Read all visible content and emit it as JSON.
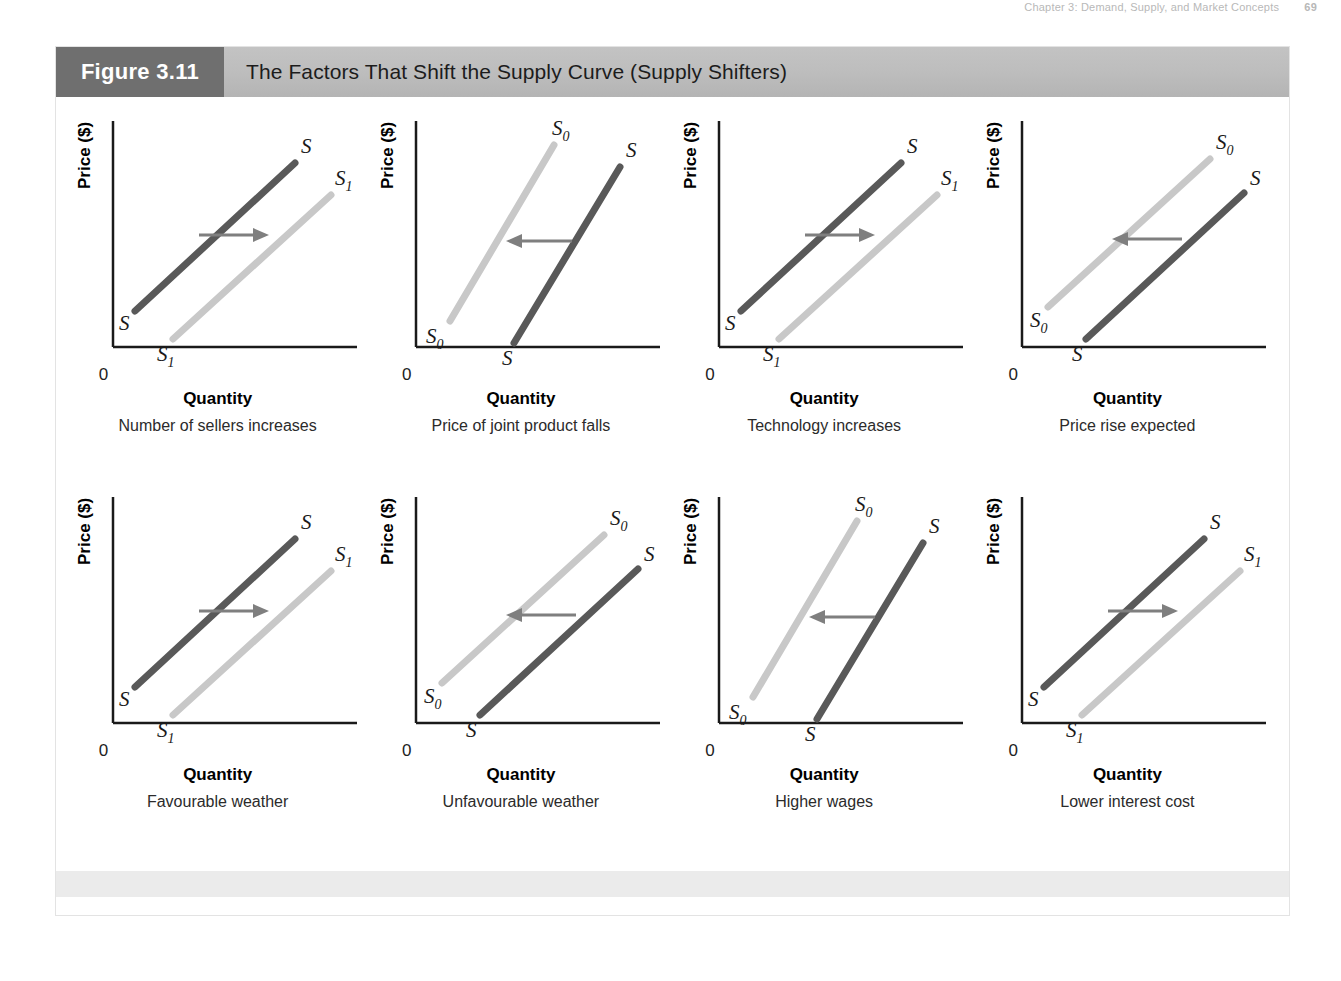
{
  "running_header": {
    "text": "Chapter 3: Demand, Supply, and Market Concepts",
    "page": "69"
  },
  "figure": {
    "number": "Figure 3.11",
    "title": "The Factors That Shift the Supply Curve (Supply Shifters)"
  },
  "axes": {
    "ylabel": "Price ($)",
    "xlabel": "Quantity",
    "origin": "0"
  },
  "colors": {
    "original_curve": "#595959",
    "shifted_curve": "#c8c8c8",
    "arrow": "#7f7f7f",
    "axis": "#1a1a1a",
    "title_block": "#6f6f6f",
    "title_bar": "#bdbdbd",
    "footer_band": "#ebebeb"
  },
  "chart_data": {
    "type": "line",
    "title": "The Factors That Shift the Supply Curve (Supply Shifters)",
    "xlabel": "Quantity",
    "ylabel": "Price ($)",
    "grid": false,
    "legend": "none",
    "note": "Eight small supply-and-shift diagrams. Each shows an original upward-sloping supply curve and a shifted supply curve, with an arrow indicating the direction of the shift.",
    "panels": [
      {
        "index": 1,
        "caption": "Number of sellers increases",
        "shift_direction": "right",
        "arrow": "→",
        "curves": [
          {
            "name": "S",
            "role": "original",
            "color": "dark",
            "label_start": "S",
            "label_end": "S"
          },
          {
            "name": "S1",
            "role": "shifted",
            "color": "light",
            "label_start": "S₁",
            "label_end": "S₁"
          }
        ]
      },
      {
        "index": 2,
        "caption": "Price of joint product falls",
        "shift_direction": "left",
        "arrow": "←",
        "curves": [
          {
            "name": "S0",
            "role": "original",
            "color": "light",
            "label_start": "S₀",
            "label_end": "S₀"
          },
          {
            "name": "S",
            "role": "shifted",
            "color": "dark",
            "label_start": "S",
            "label_end": "S"
          }
        ]
      },
      {
        "index": 3,
        "caption": "Technology increases",
        "shift_direction": "right",
        "arrow": "→",
        "curves": [
          {
            "name": "S",
            "role": "original",
            "color": "dark",
            "label_start": "S",
            "label_end": "S"
          },
          {
            "name": "S1",
            "role": "shifted",
            "color": "light",
            "label_start": "S₁",
            "label_end": "S₁"
          }
        ]
      },
      {
        "index": 4,
        "caption": "Price rise expected",
        "shift_direction": "left",
        "arrow": "←",
        "curves": [
          {
            "name": "S0",
            "role": "original",
            "color": "light",
            "label_start": "S₀",
            "label_end": "S₀"
          },
          {
            "name": "S",
            "role": "shifted",
            "color": "dark",
            "label_start": "S",
            "label_end": "S"
          }
        ]
      },
      {
        "index": 5,
        "caption": "Favourable weather",
        "shift_direction": "right",
        "arrow": "→",
        "curves": [
          {
            "name": "S",
            "role": "original",
            "color": "dark",
            "label_start": "S",
            "label_end": "S"
          },
          {
            "name": "S1",
            "role": "shifted",
            "color": "light",
            "label_start": "S₁",
            "label_end": "S₁"
          }
        ]
      },
      {
        "index": 6,
        "caption": "Unfavourable weather",
        "shift_direction": "left",
        "arrow": "←",
        "curves": [
          {
            "name": "S0",
            "role": "original",
            "color": "light",
            "label_start": "S₀",
            "label_end": "S₀"
          },
          {
            "name": "S",
            "role": "shifted",
            "color": "dark",
            "label_start": "S",
            "label_end": "S"
          }
        ]
      },
      {
        "index": 7,
        "caption": "Higher wages",
        "shift_direction": "left",
        "arrow": "←",
        "curves": [
          {
            "name": "S0",
            "role": "original",
            "color": "light",
            "label_start": "S₀",
            "label_end": "S₀"
          },
          {
            "name": "S",
            "role": "shifted",
            "color": "dark",
            "label_start": "S",
            "label_end": "S"
          }
        ]
      },
      {
        "index": 8,
        "caption": "Lower interest cost",
        "shift_direction": "right",
        "arrow": "→",
        "curves": [
          {
            "name": "S",
            "role": "original",
            "color": "dark",
            "label_start": "S",
            "label_end": "S"
          },
          {
            "name": "S1",
            "role": "shifted",
            "color": "light",
            "label_start": "S₁",
            "label_end": "S₁"
          }
        ]
      }
    ]
  }
}
